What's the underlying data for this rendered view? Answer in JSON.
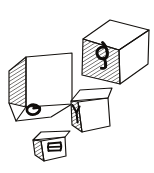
{
  "scene": {
    "title": "Hand-drawn isometric cubes with letters",
    "medium": "ink line drawing",
    "background_color": "#ffffff",
    "ink_color": "#15120f",
    "shading_style": "diagonal hatching on one face per cube",
    "cube_count": 4
  },
  "cubes": [
    {
      "id": "cube-large-left",
      "label": "G",
      "letter_description": "capital G, drawn mirrored/rotated",
      "letter_face": "bottom",
      "hatched_face": "left",
      "light_faces": [
        "front",
        "bottom"
      ],
      "approx_size_px": 62,
      "position": "left-middle"
    },
    {
      "id": "cube-large-topright",
      "label": "d",
      "letter_description": "lowercase d, drawn rotated",
      "letter_face": "left",
      "hatched_face": "left",
      "light_faces": [
        "right",
        "top"
      ],
      "approx_size_px": 70,
      "position": "top-right"
    },
    {
      "id": "cube-small-right",
      "label": "Y",
      "letter_description": "capital Y, drawn on narrow shaded face",
      "letter_face": "left",
      "hatched_face": "left",
      "light_faces": [
        "front",
        "top"
      ],
      "approx_size_px": 42,
      "position": "center-right"
    },
    {
      "id": "cube-tiny-bottom",
      "label": "B",
      "letter_description": "capital B, rotated 90 degrees",
      "letter_face": "front",
      "hatched_face": "left",
      "light_faces": [
        "front",
        "top"
      ],
      "approx_size_px": 28,
      "position": "bottom-left"
    }
  ],
  "letters_in_reading_order": [
    "G",
    "d",
    "Y",
    "B"
  ]
}
